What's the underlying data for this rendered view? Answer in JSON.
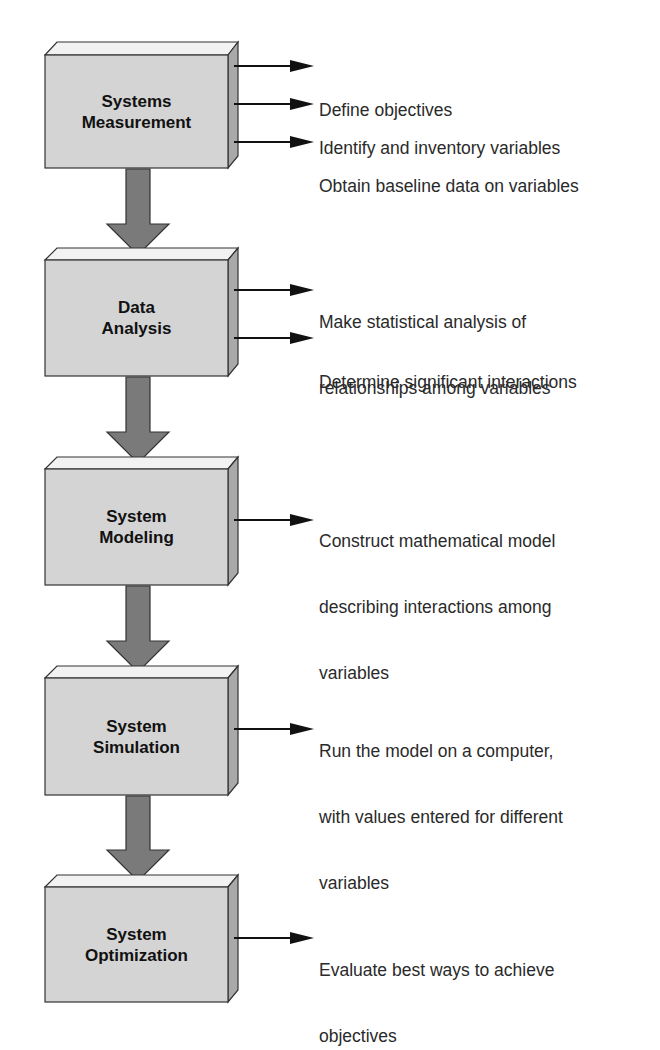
{
  "diagram": {
    "type": "vertical-process-flowchart",
    "colors": {
      "box_front": "#d4d4d4",
      "box_top": "#f2f2f2",
      "box_side": "#a9a9a9",
      "flow_arrow": "#7a7a7a",
      "outline": "#333333",
      "text": "#2a2a2a"
    },
    "steps": [
      {
        "title": "Systems Measurement",
        "title_lines": [
          "Systems",
          "Measurement"
        ],
        "outputs": [
          {
            "lines": [
              "Define objectives"
            ]
          },
          {
            "lines": [
              "Identify and inventory variables"
            ]
          },
          {
            "lines": [
              "Obtain baseline data on variables"
            ]
          }
        ]
      },
      {
        "title": "Data Analysis",
        "title_lines": [
          "Data",
          "Analysis"
        ],
        "outputs": [
          {
            "lines": [
              "Make statistical analysis of",
              "relationships among variables"
            ]
          },
          {
            "lines": [
              "Determine significant interactions"
            ]
          }
        ]
      },
      {
        "title": "System Modeling",
        "title_lines": [
          "System",
          "Modeling"
        ],
        "outputs": [
          {
            "lines": [
              "Construct mathematical model",
              "describing interactions among",
              "variables"
            ]
          }
        ]
      },
      {
        "title": "System Simulation",
        "title_lines": [
          "System",
          "Simulation"
        ],
        "outputs": [
          {
            "lines": [
              "Run the model on a computer,",
              "with values entered for different",
              "variables"
            ]
          }
        ]
      },
      {
        "title": "System Optimization",
        "title_lines": [
          "System",
          "Optimization"
        ],
        "outputs": [
          {
            "lines": [
              "Evaluate best ways to achieve",
              "objectives"
            ]
          }
        ]
      }
    ]
  }
}
